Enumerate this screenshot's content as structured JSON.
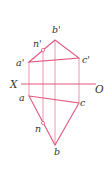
{
  "diagram": {
    "type": "orthographic-projection",
    "colors": {
      "line": "#e4577f",
      "projection": "#ec8aa6",
      "label": "#333333"
    },
    "axis": {
      "left_label": "X",
      "right_label": "O"
    },
    "front_view": {
      "points": [
        {
          "id": "a_prime",
          "label": "a'"
        },
        {
          "id": "b_prime",
          "label": "b'"
        },
        {
          "id": "c_prime",
          "label": "c'"
        },
        {
          "id": "n_prime",
          "label": "n'"
        }
      ]
    },
    "top_view": {
      "points": [
        {
          "id": "a",
          "label": "a"
        },
        {
          "id": "b",
          "label": "b"
        },
        {
          "id": "c",
          "label": "c"
        },
        {
          "id": "n",
          "label": "n"
        }
      ]
    }
  }
}
